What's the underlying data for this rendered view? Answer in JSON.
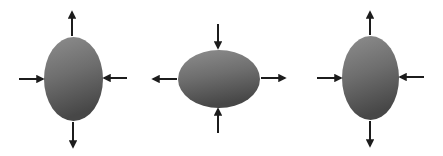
{
  "canvas": {
    "width": 443,
    "height": 156,
    "background": "#ffffff"
  },
  "colors": {
    "arrow": "#1c1c1c",
    "ellipse_top": "#8e8e8e",
    "ellipse_mid": "#6e6e6e",
    "ellipse_bottom": "#474747"
  },
  "panels": [
    {
      "id": "panel-1",
      "shape": "ellipse-vertical",
      "ellipse": {
        "cx": 73.5,
        "cy": 79,
        "rx": 29.5,
        "ry": 42
      },
      "arrows": [
        {
          "dir": "up",
          "role": "outward",
          "x1": 72,
          "y1": 36,
          "x2": 72,
          "y2": 12
        },
        {
          "dir": "down",
          "role": "outward",
          "x1": 73,
          "y1": 122,
          "x2": 73,
          "y2": 147
        },
        {
          "dir": "right",
          "role": "inward",
          "x1": 19,
          "y1": 79,
          "x2": 43,
          "y2": 79
        },
        {
          "dir": "left",
          "role": "inward",
          "x1": 127,
          "y1": 78,
          "x2": 104,
          "y2": 78
        }
      ]
    },
    {
      "id": "panel-2",
      "shape": "ellipse-horizontal",
      "ellipse": {
        "cx": 219,
        "cy": 79,
        "rx": 41,
        "ry": 29
      },
      "arrows": [
        {
          "dir": "down",
          "role": "inward",
          "x1": 218,
          "y1": 24,
          "x2": 218,
          "y2": 48
        },
        {
          "dir": "up",
          "role": "inward",
          "x1": 218,
          "y1": 133,
          "x2": 218,
          "y2": 109
        },
        {
          "dir": "left",
          "role": "outward",
          "x1": 177,
          "y1": 79,
          "x2": 153,
          "y2": 79
        },
        {
          "dir": "right",
          "role": "outward",
          "x1": 261,
          "y1": 78,
          "x2": 285,
          "y2": 78
        }
      ]
    },
    {
      "id": "panel-3",
      "shape": "ellipse-vertical",
      "ellipse": {
        "cx": 370.5,
        "cy": 78,
        "rx": 28.5,
        "ry": 42
      },
      "arrows": [
        {
          "dir": "up",
          "role": "outward",
          "x1": 370,
          "y1": 35,
          "x2": 370,
          "y2": 12
        },
        {
          "dir": "down",
          "role": "outward",
          "x1": 370,
          "y1": 121,
          "x2": 370,
          "y2": 146
        },
        {
          "dir": "right",
          "role": "inward",
          "x1": 317,
          "y1": 78,
          "x2": 341,
          "y2": 78
        },
        {
          "dir": "left",
          "role": "inward",
          "x1": 424,
          "y1": 77,
          "x2": 400,
          "y2": 77
        }
      ]
    }
  ]
}
